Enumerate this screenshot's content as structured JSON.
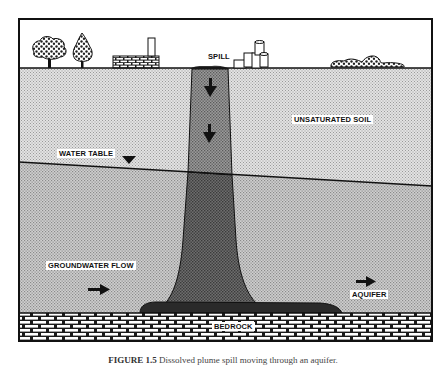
{
  "figure": {
    "labels": {
      "spill": "SPILL",
      "unsaturated_soil": "UNSATURATED SOIL",
      "water_table": "WATER TABLE",
      "groundwater_flow": "GROUNDWATER FLOW",
      "aquifer": "AQUIFER",
      "bedrock": "BEDROCK"
    },
    "caption": {
      "number": "FIGURE 1.5",
      "text": "Dissolved plume spill moving through an aquifer."
    },
    "surface_icons": [
      "tree-icon",
      "tree-icon",
      "factory-icon",
      "storage-tanks-icon",
      "rock-pile-icon"
    ],
    "colors": {
      "frame": "#111111",
      "sky": "#ffffff",
      "unsaturated_soil": "#d4d4d4",
      "aquifer": "#bcbcbc",
      "plume_upper": "#8a8a8a",
      "plume_lower": "#5e5e5e",
      "pool": "#2a2a2a",
      "bedrock_mortar": "#1a1a1a",
      "bedrock_brick": "#ffffff"
    }
  }
}
